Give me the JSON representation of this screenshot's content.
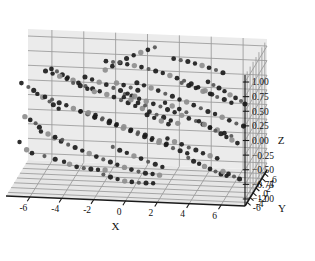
{
  "figure": {
    "type": "3d-scatter-plot",
    "width": 315,
    "height": 261,
    "background": "#ffffff",
    "pane_color": "#ebebeb",
    "pane_color_floor": "#e6e6e6",
    "grid_color": "#9a9a9a",
    "axis_line_color": "#1a1a1a",
    "point_color_dark": "#1c1c1c",
    "point_color_mid": "#555555",
    "point_color_light": "#8e8e8e"
  },
  "chart_data": {
    "type": "scatter",
    "projection": "3d",
    "title": "",
    "xlabel": "X",
    "ylabel": "Y",
    "zlabel": "Z",
    "xlim": [
      -7.5,
      7.5
    ],
    "ylim": [
      -7.5,
      7.5
    ],
    "zlim": [
      -1.12,
      1.12
    ],
    "xticks": [
      -6,
      -4,
      -2,
      0,
      2,
      4,
      6
    ],
    "yticks": [
      -6,
      -4,
      -2,
      0,
      2,
      4,
      6
    ],
    "zticks": [
      1.0,
      0.75,
      0.5,
      0.25,
      0.0,
      -0.25,
      -0.5,
      -0.75,
      -1.0
    ],
    "xticklabels": [
      "-6",
      "-4",
      "-2",
      "0",
      "2",
      "4",
      "6"
    ],
    "yticklabels": [
      "-6",
      "-4",
      "-2",
      "0",
      "2",
      "4",
      "6"
    ],
    "zticklabels": [
      "1.00",
      "0.75",
      "0.50",
      "0.25",
      "0.00",
      "−0.25",
      "−0.50",
      "−0.75",
      "−1.00"
    ],
    "grid": true,
    "legend": false,
    "n_points": 252,
    "marker": "circle",
    "points": [
      [
        -6.4,
        -4.2,
        0.62
      ],
      [
        -6.1,
        -3.8,
        0.55
      ],
      [
        -5.9,
        -3.5,
        0.48
      ],
      [
        -5.6,
        -3.1,
        0.41
      ],
      [
        -6.8,
        -4.6,
        0.7
      ],
      [
        -5.2,
        -2.8,
        0.33
      ],
      [
        -5.0,
        -2.4,
        0.26
      ],
      [
        -4.7,
        -2.0,
        0.18
      ],
      [
        -6.6,
        -4.4,
        0.12
      ],
      [
        -6.3,
        -4.0,
        0.05
      ],
      [
        -6.0,
        -3.6,
        -0.02
      ],
      [
        -5.8,
        -3.2,
        -0.1
      ],
      [
        -6.9,
        -4.8,
        -0.3
      ],
      [
        -6.5,
        -4.3,
        -0.45
      ],
      [
        -6.2,
        -3.9,
        -0.52
      ],
      [
        -5.5,
        -3.0,
        -0.6
      ],
      [
        -4.9,
        -2.2,
        -0.68
      ],
      [
        -4.4,
        -1.6,
        -0.74
      ],
      [
        -4.1,
        -1.1,
        -0.8
      ],
      [
        -3.7,
        -0.6,
        -0.86
      ],
      [
        -3.3,
        -0.1,
        -0.9
      ],
      [
        -2.9,
        0.4,
        -0.93
      ],
      [
        -2.5,
        0.9,
        -0.96
      ],
      [
        -2.1,
        1.4,
        -0.98
      ],
      [
        -5.1,
        -2.6,
        0.88
      ],
      [
        -4.8,
        -2.1,
        0.82
      ],
      [
        -4.5,
        -1.7,
        0.75
      ],
      [
        -4.2,
        -1.3,
        0.69
      ],
      [
        -3.9,
        -0.9,
        0.63
      ],
      [
        -3.6,
        -0.5,
        0.57
      ],
      [
        -3.2,
        0.0,
        0.5
      ],
      [
        -2.8,
        0.5,
        0.44
      ],
      [
        -2.4,
        1.0,
        0.38
      ],
      [
        -2.0,
        1.5,
        0.31
      ],
      [
        -1.6,
        2.0,
        0.25
      ],
      [
        -1.2,
        2.5,
        0.18
      ],
      [
        -0.8,
        3.0,
        0.12
      ],
      [
        -0.4,
        3.5,
        0.05
      ],
      [
        0.0,
        4.0,
        -0.01
      ],
      [
        0.4,
        4.5,
        -0.08
      ],
      [
        0.8,
        5.0,
        -0.15
      ],
      [
        1.2,
        5.5,
        -0.21
      ],
      [
        1.6,
        6.0,
        -0.28
      ],
      [
        2.0,
        6.4,
        -0.34
      ],
      [
        -1.9,
        -0.2,
        0.95
      ],
      [
        -1.5,
        0.3,
        0.92
      ],
      [
        -1.1,
        0.8,
        0.89
      ],
      [
        -0.7,
        1.3,
        0.85
      ],
      [
        -0.3,
        1.8,
        0.81
      ],
      [
        0.1,
        2.3,
        0.77
      ],
      [
        0.5,
        2.8,
        0.72
      ],
      [
        0.9,
        3.3,
        0.67
      ],
      [
        1.3,
        3.8,
        0.62
      ],
      [
        1.7,
        4.3,
        0.56
      ],
      [
        2.1,
        4.8,
        0.5
      ],
      [
        2.5,
        5.3,
        0.44
      ],
      [
        2.9,
        5.8,
        0.37
      ],
      [
        3.3,
        6.2,
        0.3
      ],
      [
        3.7,
        6.6,
        0.23
      ],
      [
        4.1,
        6.9,
        0.16
      ],
      [
        -0.6,
        -1.4,
        0.45
      ],
      [
        -0.2,
        -0.9,
        0.4
      ],
      [
        0.2,
        -0.4,
        0.34
      ],
      [
        0.6,
        0.1,
        0.28
      ],
      [
        1.0,
        0.6,
        0.22
      ],
      [
        1.4,
        1.1,
        0.16
      ],
      [
        1.8,
        1.6,
        0.09
      ],
      [
        2.2,
        2.1,
        0.03
      ],
      [
        2.6,
        2.6,
        -0.04
      ],
      [
        3.0,
        3.1,
        -0.11
      ],
      [
        3.4,
        3.6,
        -0.17
      ],
      [
        3.8,
        4.1,
        -0.24
      ],
      [
        4.2,
        4.6,
        -0.31
      ],
      [
        4.6,
        5.1,
        -0.37
      ],
      [
        5.0,
        5.6,
        -0.44
      ],
      [
        5.4,
        6.0,
        -0.5
      ],
      [
        0.3,
        -3.0,
        0.72
      ],
      [
        0.7,
        -2.5,
        0.66
      ],
      [
        1.1,
        -2.0,
        0.6
      ],
      [
        1.5,
        -1.5,
        0.54
      ],
      [
        1.9,
        -1.0,
        0.47
      ],
      [
        2.3,
        -0.5,
        0.41
      ],
      [
        2.7,
        0.0,
        0.34
      ],
      [
        3.1,
        0.5,
        0.28
      ],
      [
        3.5,
        1.0,
        0.21
      ],
      [
        3.9,
        1.5,
        0.14
      ],
      [
        4.3,
        2.0,
        0.07
      ],
      [
        4.7,
        2.5,
        0.01
      ],
      [
        5.1,
        3.0,
        -0.06
      ],
      [
        5.5,
        3.5,
        -0.13
      ],
      [
        5.9,
        4.0,
        -0.2
      ],
      [
        6.3,
        4.5,
        -0.26
      ],
      [
        -3.0,
        -5.5,
        0.3
      ],
      [
        -2.6,
        -5.0,
        0.24
      ],
      [
        -2.2,
        -4.5,
        0.17
      ],
      [
        -1.8,
        -4.0,
        0.11
      ],
      [
        -1.4,
        -3.5,
        0.04
      ],
      [
        -1.0,
        -3.0,
        -0.02
      ],
      [
        -0.6,
        -2.5,
        -0.09
      ],
      [
        -0.2,
        -2.0,
        -0.15
      ],
      [
        0.2,
        -1.5,
        -0.22
      ],
      [
        0.6,
        -1.0,
        -0.28
      ],
      [
        1.0,
        -0.5,
        -0.35
      ],
      [
        1.4,
        0.0,
        -0.41
      ],
      [
        1.8,
        0.5,
        -0.47
      ],
      [
        2.2,
        1.0,
        -0.54
      ],
      [
        2.6,
        1.5,
        -0.6
      ],
      [
        3.0,
        2.0,
        -0.66
      ],
      [
        -4.6,
        -6.2,
        -0.15
      ],
      [
        -4.2,
        -5.8,
        -0.22
      ],
      [
        -3.8,
        -5.3,
        -0.29
      ],
      [
        -3.4,
        -4.9,
        -0.35
      ],
      [
        -3.0,
        -4.4,
        -0.42
      ],
      [
        -2.6,
        -4.0,
        -0.48
      ],
      [
        -2.2,
        -3.5,
        -0.55
      ],
      [
        -1.8,
        -3.1,
        -0.61
      ],
      [
        -1.4,
        -2.6,
        -0.67
      ],
      [
        -1.0,
        -2.2,
        -0.73
      ],
      [
        -0.6,
        -1.7,
        -0.79
      ],
      [
        -0.2,
        -1.3,
        -0.84
      ],
      [
        0.2,
        -0.8,
        -0.89
      ],
      [
        0.6,
        -0.4,
        -0.93
      ],
      [
        1.0,
        0.1,
        -0.96
      ],
      [
        1.4,
        0.5,
        -0.99
      ],
      [
        4.9,
        -4.5,
        0.85
      ],
      [
        5.2,
        -4.0,
        0.78
      ],
      [
        5.5,
        -3.5,
        0.71
      ],
      [
        5.8,
        -3.0,
        0.64
      ],
      [
        6.1,
        -2.5,
        0.56
      ],
      [
        6.4,
        -2.0,
        0.49
      ],
      [
        6.7,
        -1.5,
        0.42
      ],
      [
        6.9,
        -1.0,
        0.35
      ],
      [
        4.4,
        -5.2,
        0.2
      ],
      [
        4.7,
        -4.8,
        0.13
      ],
      [
        5.0,
        -4.3,
        0.06
      ],
      [
        5.3,
        -3.8,
        -0.01
      ],
      [
        5.6,
        -3.3,
        -0.08
      ],
      [
        5.9,
        -2.8,
        -0.15
      ],
      [
        6.2,
        -2.3,
        -0.22
      ],
      [
        6.5,
        -1.8,
        -0.29
      ],
      [
        3.8,
        -6.0,
        -0.4
      ],
      [
        4.1,
        -5.6,
        -0.47
      ],
      [
        4.4,
        -5.1,
        -0.53
      ],
      [
        4.7,
        -4.7,
        -0.59
      ],
      [
        5.0,
        -4.2,
        -0.65
      ],
      [
        5.3,
        -3.7,
        -0.71
      ],
      [
        5.6,
        -3.2,
        -0.77
      ],
      [
        5.9,
        -2.7,
        -0.82
      ],
      [
        -2.2,
        2.6,
        0.68
      ],
      [
        -1.8,
        3.1,
        0.73
      ],
      [
        -1.4,
        3.6,
        0.78
      ],
      [
        -1.0,
        4.1,
        0.83
      ],
      [
        -0.6,
        4.6,
        0.87
      ],
      [
        -0.2,
        5.1,
        0.9
      ],
      [
        0.2,
        5.6,
        0.93
      ],
      [
        0.6,
        6.0,
        0.96
      ],
      [
        -3.4,
        1.8,
        0.58
      ],
      [
        -3.0,
        2.3,
        0.52
      ],
      [
        -2.6,
        2.8,
        0.46
      ],
      [
        -2.2,
        3.3,
        0.4
      ],
      [
        -1.8,
        3.8,
        0.33
      ],
      [
        -1.4,
        4.3,
        0.27
      ],
      [
        -1.0,
        4.8,
        0.2
      ],
      [
        -0.6,
        5.3,
        0.14
      ],
      [
        -5.8,
        0.6,
        0.26
      ],
      [
        -5.4,
        1.1,
        0.2
      ],
      [
        -5.0,
        1.6,
        0.13
      ],
      [
        -4.6,
        2.1,
        0.07
      ],
      [
        -4.2,
        2.6,
        0.0
      ],
      [
        -3.8,
        3.1,
        -0.07
      ],
      [
        -3.4,
        3.6,
        -0.13
      ],
      [
        -3.0,
        4.1,
        -0.2
      ],
      [
        2.4,
        -6.6,
        0.55
      ],
      [
        2.8,
        -6.1,
        0.48
      ],
      [
        3.2,
        -5.6,
        0.41
      ],
      [
        3.6,
        -5.1,
        0.34
      ],
      [
        1.2,
        -5.8,
        0.3
      ],
      [
        1.6,
        -5.3,
        0.23
      ],
      [
        2.0,
        -4.8,
        0.16
      ],
      [
        2.4,
        -4.3,
        0.09
      ],
      [
        -0.9,
        -6.4,
        -0.25
      ],
      [
        -0.5,
        -6.0,
        -0.32
      ],
      [
        -0.1,
        -5.5,
        -0.38
      ],
      [
        0.3,
        -5.0,
        -0.45
      ],
      [
        0.7,
        -4.5,
        -0.51
      ],
      [
        1.1,
        -4.0,
        -0.58
      ],
      [
        1.5,
        -3.5,
        -0.64
      ],
      [
        1.9,
        -3.0,
        -0.7
      ],
      [
        -2.8,
        -2.4,
        0.15
      ],
      [
        -2.4,
        -1.9,
        0.09
      ],
      [
        -2.0,
        -1.4,
        0.02
      ],
      [
        -1.6,
        -0.9,
        -0.04
      ],
      [
        -1.2,
        -0.4,
        -0.11
      ],
      [
        -0.8,
        0.1,
        -0.17
      ],
      [
        -0.4,
        0.6,
        -0.24
      ],
      [
        0.0,
        1.1,
        -0.3
      ],
      [
        0.4,
        1.6,
        -0.36
      ],
      [
        0.8,
        2.1,
        -0.43
      ],
      [
        1.2,
        2.6,
        -0.49
      ],
      [
        1.6,
        3.1,
        -0.56
      ],
      [
        -4.4,
        4.6,
        0.35
      ],
      [
        -4.0,
        5.1,
        0.29
      ],
      [
        -3.6,
        5.6,
        0.22
      ],
      [
        -3.2,
        6.0,
        0.16
      ],
      [
        2.0,
        3.6,
        0.88
      ],
      [
        2.4,
        4.1,
        0.84
      ],
      [
        2.8,
        4.6,
        0.8
      ],
      [
        3.2,
        5.1,
        0.75
      ],
      [
        3.6,
        5.6,
        0.7
      ],
      [
        4.0,
        6.0,
        0.65
      ],
      [
        4.4,
        6.4,
        0.6
      ],
      [
        4.8,
        6.8,
        0.54
      ],
      [
        -0.4,
        -4.3,
        0.52
      ],
      [
        0.0,
        -3.8,
        0.46
      ],
      [
        0.4,
        -3.3,
        0.39
      ],
      [
        0.8,
        -2.8,
        0.33
      ],
      [
        -5.6,
        -1.2,
        0.78
      ],
      [
        -5.2,
        -0.7,
        0.72
      ],
      [
        -4.8,
        -0.2,
        0.66
      ],
      [
        -4.4,
        0.3,
        0.6
      ],
      [
        3.0,
        -1.8,
        0.7
      ],
      [
        3.4,
        -1.3,
        0.64
      ],
      [
        3.8,
        -0.8,
        0.58
      ],
      [
        4.2,
        -0.3,
        0.51
      ],
      [
        4.6,
        0.2,
        0.45
      ],
      [
        5.0,
        0.7,
        0.38
      ],
      [
        5.4,
        1.2,
        0.32
      ],
      [
        5.8,
        1.7,
        0.25
      ],
      [
        -1.2,
        -0.6,
        0.6
      ],
      [
        -0.8,
        -0.1,
        0.55
      ],
      [
        -0.4,
        0.4,
        0.49
      ],
      [
        0.0,
        0.9,
        0.43
      ],
      [
        2.2,
        -2.8,
        -0.22
      ],
      [
        2.6,
        -2.3,
        -0.29
      ],
      [
        3.0,
        -1.8,
        -0.35
      ],
      [
        3.4,
        -1.3,
        -0.42
      ],
      [
        3.8,
        -0.8,
        -0.48
      ],
      [
        4.2,
        -0.3,
        -0.55
      ],
      [
        4.6,
        0.2,
        -0.61
      ],
      [
        5.0,
        0.7,
        -0.67
      ],
      [
        -1.6,
        -5.2,
        -0.78
      ],
      [
        -1.2,
        -4.7,
        -0.84
      ],
      [
        -0.8,
        -4.2,
        -0.89
      ],
      [
        -0.4,
        -3.7,
        -0.94
      ],
      [
        0.0,
        -3.2,
        -0.97
      ],
      [
        0.4,
        -2.7,
        -1.0
      ],
      [
        0.8,
        -2.2,
        -1.02
      ],
      [
        1.2,
        -1.7,
        -1.04
      ],
      [
        6.0,
        -6.2,
        -0.6
      ],
      [
        6.3,
        -5.7,
        -0.66
      ],
      [
        6.6,
        -5.2,
        -0.72
      ],
      [
        6.9,
        -4.7,
        -0.78
      ],
      [
        -6.2,
        2.2,
        -0.4
      ],
      [
        -5.8,
        2.7,
        -0.46
      ],
      [
        -5.4,
        3.2,
        -0.53
      ],
      [
        -5.0,
        3.7,
        -0.59
      ]
    ]
  }
}
